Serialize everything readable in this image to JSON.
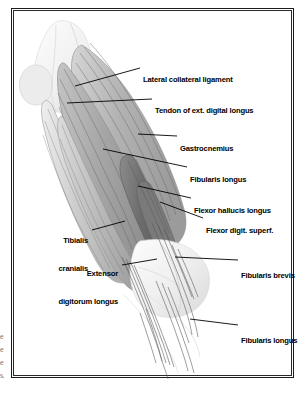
{
  "figure": {
    "plate_border_color": "#1b1b1b",
    "background_color": "#ffffff"
  },
  "margin_fragments": [
    {
      "text": "e"
    },
    {
      "text": "e"
    },
    {
      "text": "e"
    },
    {
      "text": "s."
    }
  ],
  "labels": [
    {
      "id": "lateral-collateral-ligament",
      "text": "Lateral collateral ligament",
      "lines": [
        "Lateral collateral ligament"
      ],
      "side": "right",
      "x": 131,
      "y": 51,
      "leader": {
        "x1": 128,
        "y1": 59,
        "x2": 63,
        "y2": 77
      }
    },
    {
      "id": "tendon-of-ext-digital-longus",
      "text": "Tendon of ext. digital longus",
      "lines": [
        "Tendon of ext. digital longus"
      ],
      "side": "right",
      "x": 143,
      "y": 82,
      "leader": {
        "x1": 140,
        "y1": 90,
        "x2": 55,
        "y2": 94
      }
    },
    {
      "id": "gastrocnemius",
      "text": "Gastrocnemius",
      "lines": [
        "Gastrocnemius"
      ],
      "side": "right",
      "x": 168,
      "y": 120,
      "leader": {
        "x1": 165,
        "y1": 127,
        "x2": 126,
        "y2": 125
      }
    },
    {
      "id": "fibularis-longus-upper",
      "text": "Fibularis longus",
      "lines": [
        "Fibularis longus"
      ],
      "side": "right",
      "x": 178,
      "y": 151,
      "leader": {
        "x1": 175,
        "y1": 158,
        "x2": 91,
        "y2": 140
      }
    },
    {
      "id": "flexor-hallucis-longus",
      "text": "Flexor hallucis longus",
      "lines": [
        "Flexor hallucis longus"
      ],
      "side": "right",
      "x": 182,
      "y": 182,
      "leader": {
        "x1": 179,
        "y1": 189,
        "x2": 126,
        "y2": 177
      }
    },
    {
      "id": "flexor-digit-superf",
      "text": "Flexor digit. superf.",
      "lines": [
        "Flexor digit. superf."
      ],
      "side": "right",
      "x": 194,
      "y": 202,
      "leader": {
        "x1": 191,
        "y1": 209,
        "x2": 148,
        "y2": 193
      }
    },
    {
      "id": "tibialis-cranialis",
      "text": "Tibialis cranialis",
      "lines": [
        "Tibialis",
        "cranialis"
      ],
      "side": "left",
      "x": 31,
      "y": 212,
      "leader": {
        "x1": 80,
        "y1": 221,
        "x2": 113,
        "y2": 212
      }
    },
    {
      "id": "extensor-digitorum-longus",
      "text": "Extensor digitorum longus",
      "lines": [
        "Extensor",
        "digitorum longus"
      ],
      "side": "left",
      "x": 44,
      "y": 245,
      "leader": {
        "x1": 110,
        "y1": 256,
        "x2": 145,
        "y2": 250
      }
    },
    {
      "id": "fibularis-brevis",
      "text": "Fibularis brevis",
      "lines": [
        "Fibularis brevis"
      ],
      "side": "right",
      "x": 229,
      "y": 247,
      "leader": {
        "x1": 226,
        "y1": 251,
        "x2": 163,
        "y2": 248
      }
    },
    {
      "id": "fibularis-longus-lower",
      "text": "Fibularis longus",
      "lines": [
        "Fibularis longus"
      ],
      "side": "right",
      "x": 229,
      "y": 312,
      "leader": {
        "x1": 226,
        "y1": 316,
        "x2": 178,
        "y2": 310
      }
    }
  ],
  "anatomy_regions": [
    {
      "id": "femoral-condyle",
      "tone": "#f2f2f2"
    },
    {
      "id": "patella-stifle",
      "tone": "#f7f7f7"
    },
    {
      "id": "gastrocnemius-belly",
      "tone": "#b9b9b9"
    },
    {
      "id": "fibularis-longus-belly",
      "tone": "#aeaeae"
    },
    {
      "id": "flexor-hallucis-longus-wedge",
      "tone": "#6f6f6f"
    },
    {
      "id": "flexor-digitorum-superficialis-wedge",
      "tone": "#7d7d7d"
    },
    {
      "id": "tibialis-cranialis-belly",
      "tone": "#c9c9c9"
    },
    {
      "id": "extensor-digitorum-longus-belly",
      "tone": "#bdbdbd"
    },
    {
      "id": "tarsus-hock",
      "tone": "#f1f1f1"
    },
    {
      "id": "distal-tendons",
      "tone": "#8a8a8a"
    }
  ]
}
